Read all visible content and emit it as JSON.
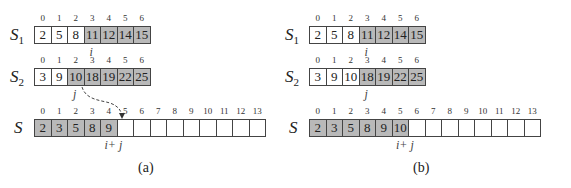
{
  "panels": [
    {
      "caption": "(a)",
      "s1": {
        "label": "S",
        "sub": "1",
        "indices": [
          "0",
          "1",
          "2",
          "3",
          "4",
          "5",
          "6"
        ],
        "values": [
          "2",
          "5",
          "8",
          "11",
          "12",
          "14",
          "15"
        ],
        "shaded": [
          false,
          false,
          false,
          true,
          true,
          true,
          true
        ],
        "pointer": "i",
        "pointer_index": 3
      },
      "s2": {
        "label": "S",
        "sub": "2",
        "indices": [
          "0",
          "1",
          "2",
          "3",
          "4",
          "5",
          "6"
        ],
        "values": [
          "3",
          "9",
          "10",
          "18",
          "19",
          "22",
          "25"
        ],
        "shaded": [
          false,
          false,
          true,
          true,
          true,
          true,
          true
        ],
        "pointer": "j",
        "pointer_index": 2
      },
      "s": {
        "label": "S",
        "indices": [
          "0",
          "1",
          "2",
          "3",
          "4",
          "5",
          "6",
          "7",
          "8",
          "9",
          "10",
          "11",
          "12",
          "13"
        ],
        "values": [
          "2",
          "3",
          "5",
          "8",
          "9",
          "",
          "",
          "",
          "",
          "",
          "",
          "",
          "",
          ""
        ],
        "shaded": [
          true,
          true,
          true,
          true,
          true,
          false,
          false,
          false,
          false,
          false,
          false,
          false,
          false,
          false
        ],
        "pointer": "i+ j",
        "pointer_index": 5
      },
      "arrow": {
        "style": "dashed",
        "from": "S2[2]",
        "to": "S[5]"
      }
    },
    {
      "caption": "(b)",
      "s1": {
        "label": "S",
        "sub": "1",
        "indices": [
          "0",
          "1",
          "2",
          "3",
          "4",
          "5",
          "6"
        ],
        "values": [
          "2",
          "5",
          "8",
          "11",
          "12",
          "14",
          "15"
        ],
        "shaded": [
          false,
          false,
          false,
          true,
          true,
          true,
          true
        ],
        "pointer": "i",
        "pointer_index": 3
      },
      "s2": {
        "label": "S",
        "sub": "2",
        "indices": [
          "0",
          "1",
          "2",
          "3",
          "4",
          "5",
          "6"
        ],
        "values": [
          "3",
          "9",
          "10",
          "18",
          "19",
          "22",
          "25"
        ],
        "shaded": [
          false,
          false,
          false,
          true,
          true,
          true,
          true
        ],
        "pointer": "j",
        "pointer_index": 3
      },
      "s": {
        "label": "S",
        "indices": [
          "0",
          "1",
          "2",
          "3",
          "4",
          "5",
          "6",
          "7",
          "8",
          "9",
          "10",
          "11",
          "12",
          "13"
        ],
        "values": [
          "2",
          "3",
          "5",
          "8",
          "9",
          "10",
          "",
          "",
          "",
          "",
          "",
          "",
          "",
          ""
        ],
        "shaded": [
          true,
          true,
          true,
          true,
          true,
          true,
          false,
          false,
          false,
          false,
          false,
          false,
          false,
          false
        ],
        "pointer": "i+ j",
        "pointer_index": 6
      }
    }
  ],
  "colors": {
    "shaded": "#b9b9b9",
    "border": "#444444",
    "background": "#ffffff"
  }
}
